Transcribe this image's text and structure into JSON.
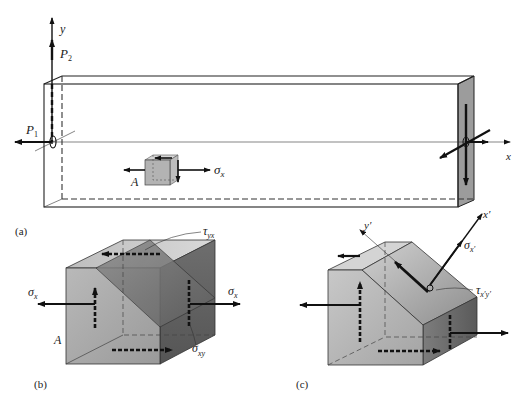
{
  "figure": {
    "panel_a": {
      "caption": "(a)",
      "axis_y": "y",
      "axis_x": "x",
      "load_p2": "P",
      "load_p2_sub": "2",
      "load_p1": "P",
      "load_p1_sub": "1",
      "point_label": "A",
      "stress_label": "σ",
      "stress_sub": "x"
    },
    "panel_b": {
      "caption": "(b)",
      "point_label": "A",
      "sigma_left": "σ",
      "sigma_left_sub": "x",
      "sigma_right": "σ",
      "sigma_right_sub": "x",
      "tau_yx": "τ",
      "tau_yx_sub": "yx",
      "sigma_xy": "σ",
      "sigma_xy_sub": "xy"
    },
    "panel_c": {
      "caption": "(c)",
      "axis_x_prime": "x′",
      "axis_y_prime": "y′",
      "sigma_xprime": "σ",
      "sigma_xprime_sub": "x′",
      "tau_xprime_yprime": "τ",
      "tau_xprime_yprime_sub": "x′y′"
    },
    "colors": {
      "face_light": "#cfcfcf",
      "face_mid": "#a9a9a9",
      "face_dark": "#7a7a7a",
      "line": "#222222"
    }
  }
}
